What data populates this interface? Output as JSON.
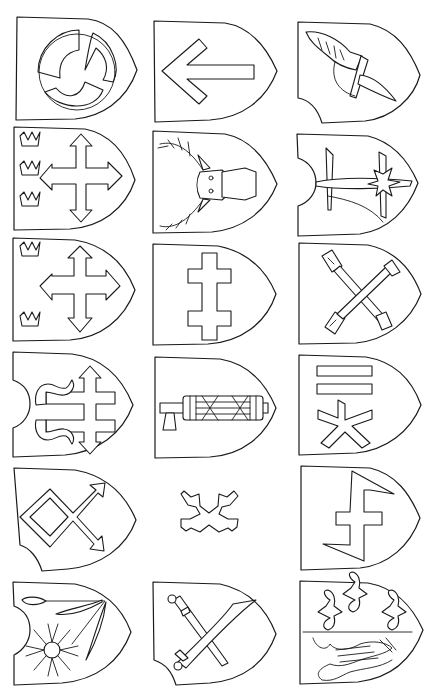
{
  "sheet": {
    "title": "",
    "background": "#ffffff",
    "line_color": "#1a1a1a",
    "layout": {
      "rows": 6,
      "columns": 3
    }
  },
  "shields": [
    {
      "row": 1,
      "col": 1,
      "shape": "plain-pointed",
      "charge": "three-armed-triskelion-ring"
    },
    {
      "row": 1,
      "col": 2,
      "shape": "plain-pointed",
      "charge": "left-arrow"
    },
    {
      "row": 1,
      "col": 3,
      "shape": "notched-bottom-left",
      "charge": "winged-helmet"
    },
    {
      "row": 2,
      "col": 1,
      "shape": "plain-pointed",
      "charge": "arrow-cross-with-three-crowns"
    },
    {
      "row": 2,
      "col": 2,
      "shape": "plain-pointed",
      "charge": "stag-head"
    },
    {
      "row": 2,
      "col": 3,
      "shape": "notched-left",
      "charge": "sword-and-cross-with-ship-sail"
    },
    {
      "row": 3,
      "col": 1,
      "shape": "plain-pointed",
      "charge": "arrow-cross-with-two-crowns"
    },
    {
      "row": 3,
      "col": 2,
      "shape": "plain-pointed",
      "charge": "double-cross"
    },
    {
      "row": 3,
      "col": 3,
      "shape": "plain-pointed",
      "charge": "crossed-hammers"
    },
    {
      "row": 4,
      "col": 1,
      "shape": "notched-left",
      "charge": "double-cross-with-flames"
    },
    {
      "row": 4,
      "col": 2,
      "shape": "plain-pointed",
      "charge": "fasces-axe"
    },
    {
      "row": 4,
      "col": 3,
      "shape": "plain-pointed",
      "charge": "two-bars-and-asterisk"
    },
    {
      "row": 5,
      "col": 1,
      "shape": "notched-bottom-left",
      "charge": "diamond-with-arrows"
    },
    {
      "row": 5,
      "col": 2,
      "shape": "none",
      "charge": "saltire-crosslet"
    },
    {
      "row": 5,
      "col": 3,
      "shape": "plain-pointed",
      "charge": "zigzag-cross"
    },
    {
      "row": 6,
      "col": 1,
      "shape": "notched-left",
      "charge": "cornflower-and-wheat"
    },
    {
      "row": 6,
      "col": 2,
      "shape": "notched-bottom-left",
      "charge": "crossed-sword-and-sabre"
    },
    {
      "row": 6,
      "col": 3,
      "shape": "plain-pointed",
      "charge": "fleurs-de-lis-and-dragon"
    }
  ]
}
